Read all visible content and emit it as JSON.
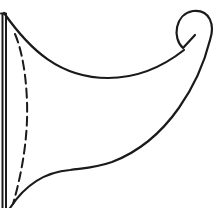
{
  "figure": {
    "description": "Line drawing of a horn / cornucopia-like shape attached to a vertical pole, with a scroll curl at the top right and a dashed inner curve",
    "colors": {
      "background": "#ffffff",
      "line": "#1a1a1a"
    },
    "stroke_width": 2.2,
    "dash_pattern": "9 5"
  }
}
